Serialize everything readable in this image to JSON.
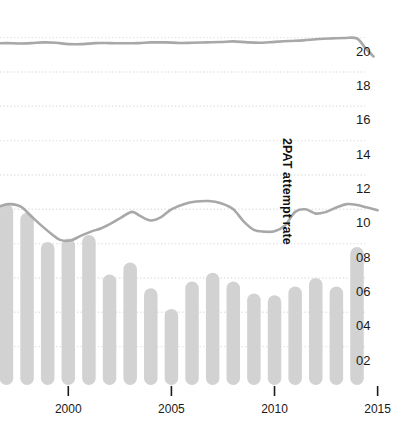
{
  "chart_data": {
    "type": "bar",
    "title": "",
    "xlabel": "",
    "ylabel": "2PAT attempt rate",
    "xlim": [
      1996.3,
      2015.6
    ],
    "ylim": [
      0.0,
      0.212
    ],
    "grid": true,
    "legend": "none",
    "y_ticks": [
      0.02,
      0.04,
      0.06,
      0.08,
      0.1,
      0.12,
      0.14,
      0.16,
      0.18,
      0.2
    ],
    "y_tick_labels": [
      "02",
      "04",
      "06",
      "08",
      "10",
      "12",
      "14",
      "16",
      "18",
      "20"
    ],
    "x_ticks": [
      2000,
      2005,
      2010,
      2015
    ],
    "x_tick_labels": [
      "2000",
      "2005",
      "2010",
      "2015"
    ],
    "categories": [
      1997,
      1998,
      1999,
      2000,
      2001,
      2002,
      2003,
      2004,
      2005,
      2006,
      2007,
      2008,
      2009,
      2010,
      2011,
      2012,
      2013,
      2014
    ],
    "values": [
      0.103,
      0.098,
      0.081,
      0.083,
      0.085,
      0.062,
      0.069,
      0.054,
      0.042,
      0.058,
      0.063,
      0.058,
      0.051,
      0.05,
      0.055,
      0.06,
      0.055,
      0.078
    ],
    "series": [
      {
        "name": "upper-line",
        "x": [
          1996.3,
          1997.0,
          1997.6,
          1998.2,
          1998.8,
          1999.4,
          2000.0,
          2000.7,
          2001.3,
          2002.0,
          2002.7,
          2003.4,
          2004.0,
          2004.7,
          2005.4,
          2006.0,
          2006.7,
          2007.4,
          2008.0,
          2008.7,
          2009.4,
          2010.0,
          2010.7,
          2011.4,
          2012.0,
          2012.7,
          2013.4,
          2014.0,
          2014.4,
          2014.8
        ],
        "values": [
          0.1965,
          0.1968,
          0.1966,
          0.1968,
          0.1972,
          0.197,
          0.1962,
          0.1962,
          0.1968,
          0.1968,
          0.1967,
          0.1968,
          0.1972,
          0.1972,
          0.1969,
          0.197,
          0.1972,
          0.1974,
          0.1978,
          0.1972,
          0.197,
          0.1975,
          0.198,
          0.1984,
          0.199,
          0.1995,
          0.1998,
          0.1995,
          0.194,
          0.189
        ]
      },
      {
        "name": "lower-line",
        "x": [
          1996.3,
          1996.8,
          1997.2,
          1997.7,
          1998.2,
          1998.7,
          1999.2,
          1999.6,
          2000.1,
          2000.6,
          2001.1,
          2001.6,
          2002.1,
          2002.6,
          2003.1,
          2003.5,
          2004.0,
          2004.5,
          2005.0,
          2005.6,
          2006.2,
          2006.8,
          2007.4,
          2008.0,
          2008.5,
          2009.0,
          2009.5,
          2010.0,
          2010.5,
          2011.0,
          2011.5,
          2012.0,
          2012.5,
          2013.0,
          2013.5,
          2014.0,
          2014.5,
          2015.0
        ],
        "values": [
          0.0995,
          0.1022,
          0.103,
          0.1015,
          0.096,
          0.0905,
          0.0855,
          0.0822,
          0.0818,
          0.0845,
          0.087,
          0.089,
          0.092,
          0.0955,
          0.0985,
          0.096,
          0.0935,
          0.0955,
          0.1,
          0.103,
          0.1045,
          0.1048,
          0.1035,
          0.1,
          0.093,
          0.088,
          0.087,
          0.0872,
          0.0905,
          0.0985,
          0.1,
          0.0975,
          0.0985,
          0.101,
          0.103,
          0.1025,
          0.101,
          0.0995
        ]
      }
    ],
    "colors": {
      "bar": "#d2d2d2",
      "line": "#a8a8a8",
      "grid": "#e4e4e4",
      "text": "#1a1a1a"
    }
  }
}
